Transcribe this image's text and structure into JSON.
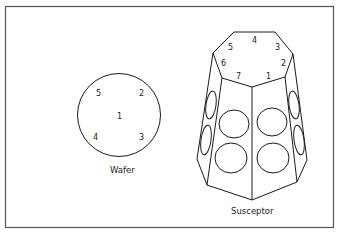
{
  "figure": {
    "wafer": {
      "caption": "Wafer",
      "points": [
        "1",
        "2",
        "3",
        "4",
        "5"
      ]
    },
    "susceptor": {
      "caption": "Susceptor",
      "positions": [
        "1",
        "2",
        "3",
        "4",
        "5",
        "6",
        "7"
      ]
    }
  }
}
